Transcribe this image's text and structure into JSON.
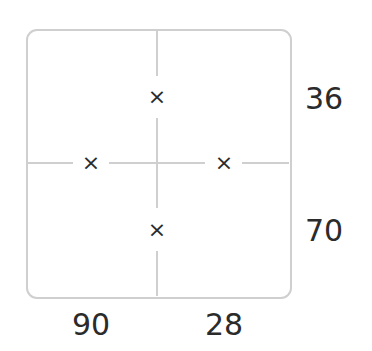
{
  "puzzle": {
    "mark_symbol": "×",
    "right_labels": [
      "36",
      "70"
    ],
    "bottom_labels": [
      "90",
      "28"
    ],
    "colors": {
      "lines": "#cfcfcf",
      "text": "#2b2b2b"
    }
  }
}
